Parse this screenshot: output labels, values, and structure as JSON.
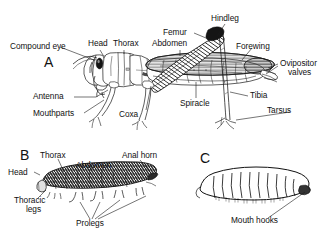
{
  "figure": {
    "background_color": "#ffffff",
    "ink_color": "#1a1a1a"
  },
  "panels": [
    {
      "letter": "A",
      "name": "grasshopper-adult",
      "labels": [
        {
          "id": "compound-eye",
          "text": "Compound eye"
        },
        {
          "id": "head",
          "text": "Head"
        },
        {
          "id": "thorax",
          "text": "Thorax"
        },
        {
          "id": "abdomen",
          "text": "Abdomen"
        },
        {
          "id": "femur",
          "text": "Femur"
        },
        {
          "id": "hindleg",
          "text": "Hindleg"
        },
        {
          "id": "forewing",
          "text": "Forewing"
        },
        {
          "id": "ovipositor",
          "text": "Ovipositor"
        },
        {
          "id": "ovipositor-2",
          "text": "valves"
        },
        {
          "id": "tibia",
          "text": "Tibia"
        },
        {
          "id": "tarsus",
          "text": "Tarsus"
        },
        {
          "id": "spiracle",
          "text": "Spiracle"
        },
        {
          "id": "coxa",
          "text": "Coxa"
        },
        {
          "id": "antenna",
          "text": "Antenna"
        },
        {
          "id": "mouthparts",
          "text": "Mouthparts"
        }
      ]
    },
    {
      "letter": "B",
      "name": "caterpillar-larva",
      "labels": [
        {
          "id": "b-thorax",
          "text": "Thorax"
        },
        {
          "id": "b-head",
          "text": "Head"
        },
        {
          "id": "b-abdomen",
          "text": "Abdomen"
        },
        {
          "id": "b-anal-horn",
          "text": "Anal horn"
        },
        {
          "id": "b-thoracic",
          "text": "Thoracic"
        },
        {
          "id": "b-legs",
          "text": "legs"
        },
        {
          "id": "b-prolegs",
          "text": "Prolegs"
        }
      ]
    },
    {
      "letter": "C",
      "name": "maggot-larva",
      "labels": [
        {
          "id": "c-mouth-hooks",
          "text": "Mouth hooks"
        }
      ]
    }
  ]
}
